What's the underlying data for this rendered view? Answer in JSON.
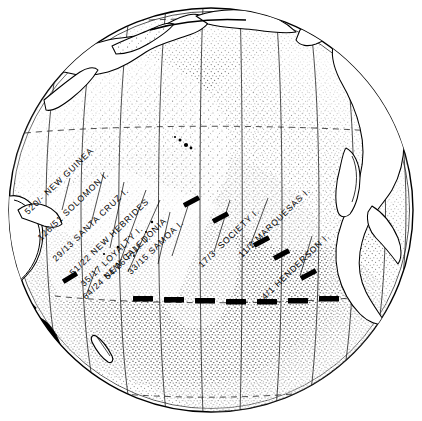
{
  "figure": {
    "projection": "orthographic globe",
    "globe": {
      "center_x": 211,
      "center_y": 210,
      "radius": 203,
      "outline_color": "#000000",
      "ocean_fill": "#ffffff",
      "ocean_stipple_color": "#1a1a1a",
      "land_fill": "#ffffff",
      "land_outline_color": "#000000"
    },
    "graticule": {
      "meridian_count": 11,
      "meridian_color": "#000000",
      "latitude_lines": [
        {
          "name": "equator",
          "style": "dashed-thin",
          "y": 133
        },
        {
          "name": "tropic-of-capricorn",
          "style": "dashed-thin",
          "y": 296
        },
        {
          "name": "north-dashed-arc",
          "style": "dashed-thin",
          "y": 22
        }
      ]
    },
    "boundary_line": {
      "name": "faunal boundary",
      "style": "thick black dashes",
      "color": "#000000",
      "segments_diagonal": 5,
      "segments_horizontal": 8
    }
  },
  "labels": [
    {
      "id": "new-guinea",
      "ratio": "520/-",
      "name": "NEW GUINEA",
      "text": "520/- NEW GUINEA",
      "x": 28,
      "y": 215,
      "rotate": -44
    },
    {
      "id": "solomon",
      "ratio": "126/51",
      "name": "SOLOMON I.",
      "text": "126/51 SOLOMON I.",
      "x": 41,
      "y": 241,
      "rotate": -44
    },
    {
      "id": "santa-cruz",
      "ratio": "29/13",
      "name": "SANTA CRUZ I.",
      "text": "29/13 SANTA CRUZ I.",
      "x": 56,
      "y": 262,
      "rotate": -44
    },
    {
      "id": "new-hebrides",
      "ratio": "51/22",
      "name": "NEW HEBRIDES",
      "text": "51/22 NEW HEBRIDES",
      "x": 73,
      "y": 276,
      "rotate": -44
    },
    {
      "id": "loyalty",
      "ratio": "35/17",
      "name": "LOYALTY I.",
      "text": "35/17 LOYALTY I.",
      "x": 84,
      "y": 287,
      "rotate": -44
    },
    {
      "id": "fiji",
      "ratio": "54/26",
      "name": "FIJI I.",
      "text": "54/26 FIJI  I.",
      "x": 108,
      "y": 280,
      "rotate": -44
    },
    {
      "id": "samoa",
      "ratio": "33/15",
      "name": "SAMOA I.",
      "text": "33/15 SAMOA I.",
      "x": 131,
      "y": 275,
      "rotate": -44
    },
    {
      "id": "society",
      "ratio": "17/3",
      "name": "SOCIETY I.",
      "text": "17/3  SOCIETY I.",
      "x": 202,
      "y": 268,
      "rotate": -44
    },
    {
      "id": "marquesas",
      "ratio": "11/2",
      "name": "MARQUESAS I.",
      "text": "11/2 MARQUESAS I.",
      "x": 242,
      "y": 258,
      "rotate": -44
    },
    {
      "id": "henderson",
      "ratio": "4/1",
      "name": "HENDERSON I.",
      "text": "4/1 HENDERSON I.",
      "x": 265,
      "y": 300,
      "rotate": -44
    },
    {
      "id": "new-caledonia",
      "ratio": "64/24",
      "name": "NEW CALEDONIA",
      "text": "64/24 NEW CALEDONIA",
      "x": 86,
      "y": 300,
      "rotate": -44
    }
  ]
}
